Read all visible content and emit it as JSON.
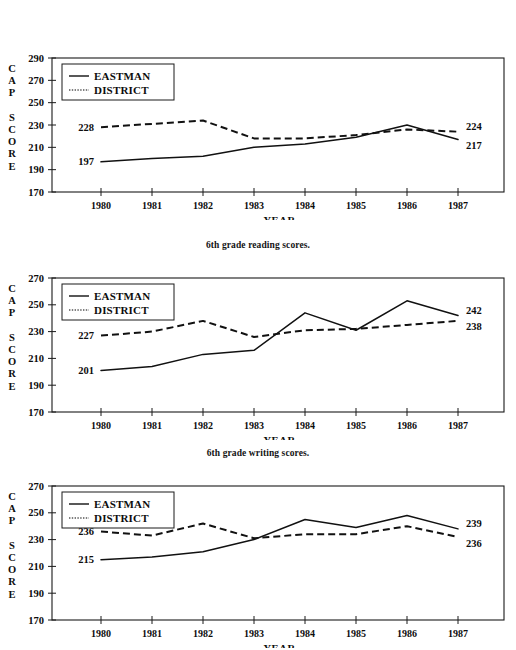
{
  "document": {
    "background_color": "#ffffff",
    "ink_color": "#111111"
  },
  "charts": [
    {
      "id": "reading",
      "caption": "6th grade reading scores.",
      "legend": {
        "eastman_label": "EASTMAN",
        "district_label": "DISTRICT"
      },
      "y_axis_label_lines": [
        "C",
        "A",
        "P",
        "",
        "S",
        "C",
        "O",
        "R",
        "E"
      ],
      "x_axis_title": "YEAR",
      "endpoint_labels": {
        "eastman_start": "197",
        "district_start": "228",
        "eastman_end": "217",
        "district_end": "224"
      },
      "chart_data": {
        "type": "line",
        "title": "6th grade reading scores.",
        "xlabel": "YEAR",
        "ylabel": "CAP SCORE",
        "categories": [
          "1980",
          "1981",
          "1982",
          "1983",
          "1984",
          "1985",
          "1986",
          "1987"
        ],
        "ylim": [
          170,
          290
        ],
        "yticks": [
          170,
          190,
          210,
          230,
          250,
          270,
          290
        ],
        "grid": false,
        "legend_position": "top-left",
        "series": [
          {
            "name": "EASTMAN",
            "style": "solid",
            "values": [
              197,
              200,
              202,
              210,
              213,
              219,
              230,
              217
            ]
          },
          {
            "name": "DISTRICT",
            "style": "dashed",
            "values": [
              228,
              231,
              234,
              218,
              218,
              221,
              226,
              224
            ]
          }
        ]
      }
    },
    {
      "id": "writing",
      "caption": "6th grade writing scores.",
      "legend": {
        "eastman_label": "EASTMAN",
        "district_label": "DISTRICT"
      },
      "y_axis_label_lines": [
        "C",
        "A",
        "P",
        "",
        "S",
        "C",
        "O",
        "R",
        "E"
      ],
      "x_axis_title": "YEAR",
      "endpoint_labels": {
        "eastman_start": "201",
        "district_start": "227",
        "eastman_end": "242",
        "district_end": "238"
      },
      "chart_data": {
        "type": "line",
        "title": "6th grade writing scores.",
        "xlabel": "YEAR",
        "ylabel": "CAP SCORE",
        "categories": [
          "1980",
          "1981",
          "1982",
          "1983",
          "1984",
          "1985",
          "1986",
          "1987"
        ],
        "ylim": [
          170,
          270
        ],
        "yticks": [
          170,
          190,
          210,
          230,
          250,
          270
        ],
        "grid": false,
        "legend_position": "top-left",
        "series": [
          {
            "name": "EASTMAN",
            "style": "solid",
            "values": [
              201,
              204,
              213,
              216,
              244,
              231,
              253,
              242
            ]
          },
          {
            "name": "DISTRICT",
            "style": "dashed",
            "values": [
              227,
              230,
              238,
              226,
              231,
              232,
              235,
              238
            ]
          }
        ]
      }
    },
    {
      "id": "math",
      "caption": "",
      "legend": {
        "eastman_label": "EASTMAN",
        "district_label": "DISTRICT"
      },
      "y_axis_label_lines": [
        "C",
        "A",
        "P",
        "",
        "S",
        "C",
        "O",
        "R",
        "E"
      ],
      "x_axis_title": "YEAR",
      "endpoint_labels": {
        "eastman_start": "215",
        "district_start": "236",
        "eastman_end": "239",
        "district_end": "236"
      },
      "chart_data": {
        "type": "line",
        "title": "",
        "xlabel": "YEAR",
        "ylabel": "CAP SCORE",
        "categories": [
          "1980",
          "1981",
          "1982",
          "1983",
          "1984",
          "1985",
          "1986",
          "1987"
        ],
        "ylim": [
          170,
          270
        ],
        "yticks": [
          170,
          190,
          210,
          230,
          250,
          270
        ],
        "grid": false,
        "legend_position": "top-left",
        "series": [
          {
            "name": "EASTMAN",
            "style": "solid",
            "values": [
              215,
              217,
              221,
              230,
              245,
              239,
              248,
              238
            ]
          },
          {
            "name": "DISTRICT",
            "style": "dashed",
            "values": [
              236,
              233,
              242,
              231,
              234,
              234,
              240,
              232
            ]
          }
        ]
      }
    }
  ]
}
